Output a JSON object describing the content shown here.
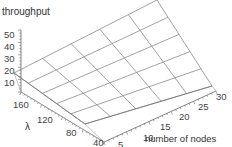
{
  "chart_data": {
    "type": "surface",
    "title": "",
    "zlabel": "throughput",
    "xlabel": "number of nodes",
    "ylabel": "λ",
    "z_ticks": [
      "10",
      "20",
      "30",
      "40",
      "50"
    ],
    "lambda_ticks": [
      "160",
      "120",
      "80",
      "40"
    ],
    "nodes_ticks": [
      "5",
      "10",
      "15",
      "20",
      "25",
      "30"
    ],
    "x": [
      5,
      10,
      15,
      20,
      25,
      30
    ],
    "y": [
      40,
      80,
      120,
      160
    ],
    "grid_cells": 5,
    "surface_description": "throughput increases roughly linearly with both λ and number of nodes",
    "corner_values": {
      "nodes5_lambda40": 8,
      "nodes30_lambda40": 30,
      "nodes5_lambda160": 20,
      "nodes30_lambda160": 55
    },
    "line_color": "#8a8a8a",
    "axis_color": "#666666"
  }
}
